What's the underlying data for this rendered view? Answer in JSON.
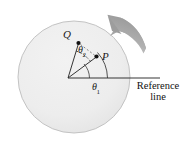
{
  "figure": {
    "type": "physics-diagram",
    "canvas": {
      "width": 191,
      "height": 141,
      "background": "#ffffff"
    },
    "disk": {
      "name": "rotating-disk",
      "center_x": 74,
      "center_y": 77,
      "radius": 56,
      "fill": "#ececec",
      "stroke": "#b9b9b9"
    },
    "pivot": {
      "x": 68,
      "y": 78
    },
    "points": [
      {
        "id": "Q",
        "label": "Q",
        "dot_x": 78,
        "dot_y": 43,
        "label_x": 63,
        "label_y": 29
      },
      {
        "id": "P",
        "label": "P",
        "dot_x": 96,
        "dot_y": 57,
        "label_x": 102,
        "label_y": 51
      }
    ],
    "angles": [
      {
        "id": "theta1",
        "symbol": "θ",
        "subscript": "1",
        "label": "θ₁",
        "description": "angle from reference line to radius OP",
        "label_x": 92,
        "label_y": 82,
        "arc_style": "solid"
      },
      {
        "id": "theta2",
        "symbol": "θ",
        "subscript": "2",
        "label": "θ₂",
        "description": "angle between radius OP and radius OQ",
        "label_x": 78,
        "label_y": 45,
        "arc_style": "dashed"
      }
    ],
    "reference_line": {
      "label_line_1": "Reference",
      "label_line_2": "line",
      "x_start": 68,
      "y": 78,
      "x_end": 160,
      "stroke": "#2b2b2b"
    },
    "rotation_arrow": {
      "name": "rotation-direction-arrow",
      "direction": "counterclockwise",
      "fill": "#a3a3a3",
      "tip_x": 108,
      "tip_y": 15
    },
    "colors": {
      "disk_fill": "#ececec",
      "disk_stroke": "#b9b9b9",
      "line": "#2b2b2b",
      "arrow": "#a3a3a3",
      "text": "#1a1a1a",
      "background": "#ffffff"
    }
  }
}
